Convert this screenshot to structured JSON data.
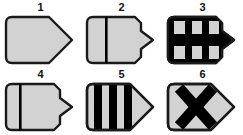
{
  "figure": {
    "title": "",
    "background_color": "#ffffff",
    "shape_fill_color": "#d2d2d2",
    "shape_stroke_color": "#1a1a1a",
    "marking_color": "#000000",
    "label_color": "#111111",
    "grid": {
      "columns": 3,
      "rows": 2
    },
    "items": [
      {
        "label": "1",
        "name": "shape-plain-pentagon",
        "body": "pentagon-long-point",
        "marking": "none",
        "marking_description": "no internal markings",
        "stripe_count": 0
      },
      {
        "label": "2",
        "name": "shape-single-thin-line",
        "body": "rounded-rect-small-point",
        "marking": "thin-vertical-line",
        "marking_description": "one thin vertical black line left of centre",
        "stripe_count": 1
      },
      {
        "label": "3",
        "name": "shape-grid-cross-bars",
        "body": "rounded-rect-small-point",
        "marking": "horizontal-band-plus-vertical-bars",
        "marking_description": "thick horizontal black band crossing three thick vertical black bars, forming a grid of six light cells",
        "stripe_count": 3,
        "band_count": 1
      },
      {
        "label": "4",
        "name": "shape-single-thin-line-left",
        "body": "rounded-rect-small-point",
        "marking": "thin-vertical-line",
        "marking_description": "one thin vertical black line near the left edge",
        "stripe_count": 1
      },
      {
        "label": "5",
        "name": "shape-three-thick-bars",
        "body": "rounded-rect-long-point",
        "marking": "three-vertical-bars",
        "marking_description": "three thick vertical black bars",
        "stripe_count": 3
      },
      {
        "label": "6",
        "name": "shape-x-cross",
        "body": "rounded-rect-long-point",
        "marking": "x-cross",
        "marking_description": "bold black X (diagonal cross) centred in the body",
        "stripe_count": 0
      }
    ]
  }
}
